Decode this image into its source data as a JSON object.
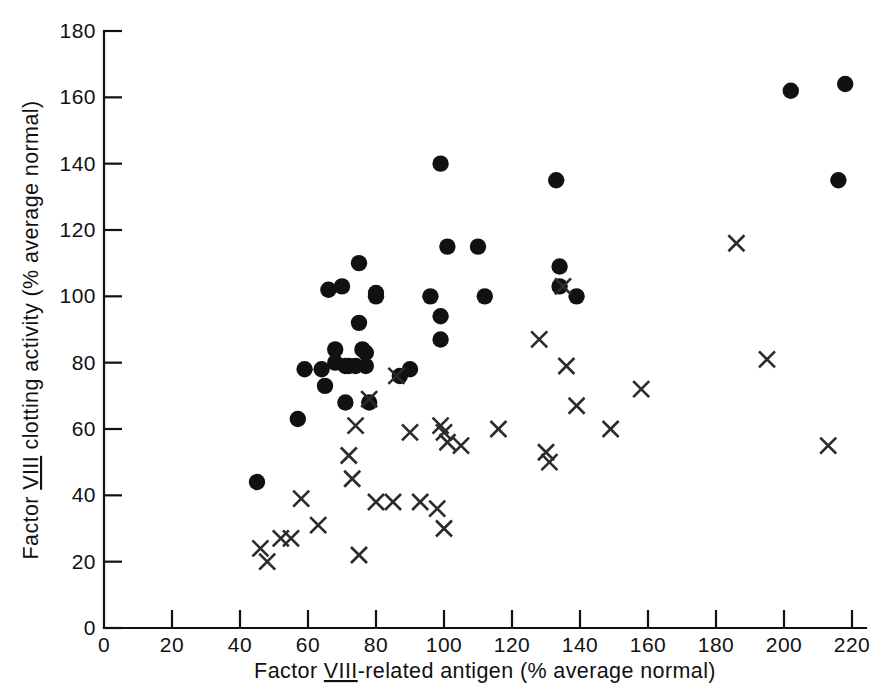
{
  "chart_data": {
    "type": "scatter",
    "title": "",
    "xlabel": "Factor VIII-related antigen (% average normal)",
    "ylabel": "Factor VIII clotting activity (% average normal)",
    "xlabel_parts": {
      "prefix": "Factor ",
      "roman": "VIII",
      "suffix": "-related antigen (% average normal)"
    },
    "ylabel_parts": {
      "prefix": "Factor ",
      "roman": "VIII",
      "suffix": " clotting activity (% average normal)"
    },
    "xlim": [
      0,
      225
    ],
    "ylim": [
      0,
      183
    ],
    "xticks": [
      0,
      20,
      40,
      60,
      80,
      100,
      120,
      140,
      160,
      180,
      200,
      220
    ],
    "yticks": [
      0,
      20,
      40,
      60,
      80,
      100,
      120,
      140,
      160,
      180
    ],
    "xticklabels": [
      "0",
      "20",
      "40",
      "60",
      "80",
      "100",
      "120",
      "140",
      "160",
      "180",
      "200",
      "220"
    ],
    "yticklabels": [
      "0",
      "20",
      "40",
      "60",
      "80",
      "100",
      "120",
      "140",
      "160",
      "180"
    ],
    "grid": false,
    "legend": "none",
    "series": [
      {
        "name": "filled-circle-group",
        "marker": "filled-circle",
        "color": "#111111",
        "points": [
          [
            45,
            44
          ],
          [
            57,
            63
          ],
          [
            59,
            78
          ],
          [
            64,
            78
          ],
          [
            65,
            73
          ],
          [
            66,
            102
          ],
          [
            68,
            84
          ],
          [
            68,
            80
          ],
          [
            70,
            103
          ],
          [
            71,
            79
          ],
          [
            71,
            68
          ],
          [
            72,
            79
          ],
          [
            74,
            79
          ],
          [
            75,
            110
          ],
          [
            75,
            92
          ],
          [
            76,
            84
          ],
          [
            77,
            83
          ],
          [
            77,
            79
          ],
          [
            78,
            68
          ],
          [
            80,
            101
          ],
          [
            80,
            100
          ],
          [
            87,
            76
          ],
          [
            90,
            78
          ],
          [
            96,
            100
          ],
          [
            99,
            140
          ],
          [
            99,
            94
          ],
          [
            99,
            87
          ],
          [
            101,
            115
          ],
          [
            110,
            115
          ],
          [
            112,
            100
          ],
          [
            133,
            135
          ],
          [
            134,
            109
          ],
          [
            134,
            103
          ],
          [
            139,
            100
          ],
          [
            202,
            162
          ],
          [
            216,
            135
          ],
          [
            218,
            164
          ]
        ]
      },
      {
        "name": "cross-group",
        "marker": "x-cross",
        "color": "#2b2b2b",
        "points": [
          [
            46,
            24
          ],
          [
            48,
            20
          ],
          [
            52,
            27
          ],
          [
            55,
            27
          ],
          [
            58,
            39
          ],
          [
            63,
            31
          ],
          [
            72,
            52
          ],
          [
            73,
            45
          ],
          [
            74,
            61
          ],
          [
            75,
            22
          ],
          [
            78,
            69
          ],
          [
            80,
            38
          ],
          [
            85,
            38
          ],
          [
            86,
            76
          ],
          [
            90,
            59
          ],
          [
            93,
            38
          ],
          [
            98,
            36
          ],
          [
            99,
            61
          ],
          [
            100,
            59
          ],
          [
            100,
            30
          ],
          [
            101,
            56
          ],
          [
            105,
            55
          ],
          [
            116,
            60
          ],
          [
            128,
            87
          ],
          [
            130,
            53
          ],
          [
            131,
            50
          ],
          [
            135,
            103
          ],
          [
            136,
            79
          ],
          [
            139,
            67
          ],
          [
            149,
            60
          ],
          [
            158,
            72
          ],
          [
            186,
            116
          ],
          [
            195,
            81
          ],
          [
            213,
            55
          ]
        ]
      }
    ]
  },
  "axes": {
    "x_axis_name": "x-axis",
    "y_axis_name": "y-axis"
  }
}
